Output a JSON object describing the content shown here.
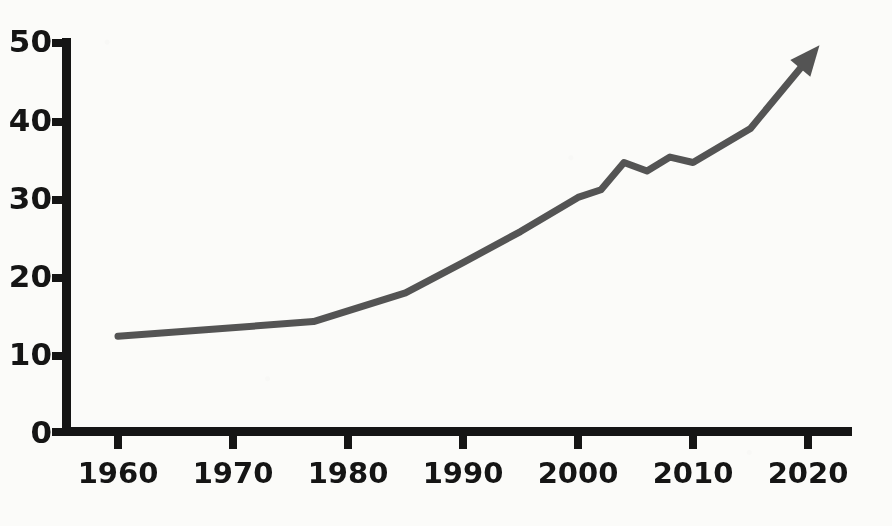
{
  "chart_data": {
    "type": "line",
    "title": "",
    "subtitle": "",
    "xlabel": "",
    "ylabel": "",
    "xlim": [
      1954,
      2026
    ],
    "ylim": [
      0,
      52
    ],
    "grid": false,
    "legend": null,
    "annotations": [
      "arrowhead at end of line pointing up-right"
    ],
    "x_ticks": [
      1960,
      1970,
      1980,
      1990,
      2000,
      2010,
      2020
    ],
    "x_tick_labels": [
      "1960",
      "1970",
      "1980",
      "1990",
      "2000",
      "2010",
      "2020"
    ],
    "y_ticks": [
      0,
      10,
      20,
      30,
      40,
      50
    ],
    "y_tick_labels": [
      "0",
      "10",
      "20",
      "30",
      "40",
      "50"
    ],
    "series": [
      {
        "name": "series-1",
        "color": "#545454",
        "x": [
          1960,
          1977,
          1985,
          1990,
          1995,
          2000,
          2002,
          2004,
          2006,
          2008,
          2010,
          2015,
          2021
        ],
        "values": [
          12.2,
          14.1,
          17.8,
          21.7,
          25.7,
          30.1,
          31.1,
          34.6,
          33.5,
          35.3,
          34.6,
          39.0,
          49.7
        ]
      }
    ]
  },
  "axes": {
    "axis_color": "#151515",
    "line_color": "#545454"
  }
}
